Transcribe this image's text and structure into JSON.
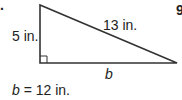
{
  "problem": {
    "number_fragment_left": ".",
    "number_fragment_right": "9"
  },
  "triangle": {
    "type": "right-triangle",
    "vertical_leg_label": "5 in.",
    "hypotenuse_label": "13 in.",
    "base_label": "b",
    "right_angle_marker": "bottom-left",
    "stroke_color": "#333333"
  },
  "answer": {
    "variable": "b",
    "equals": "=",
    "value": "12 in."
  }
}
